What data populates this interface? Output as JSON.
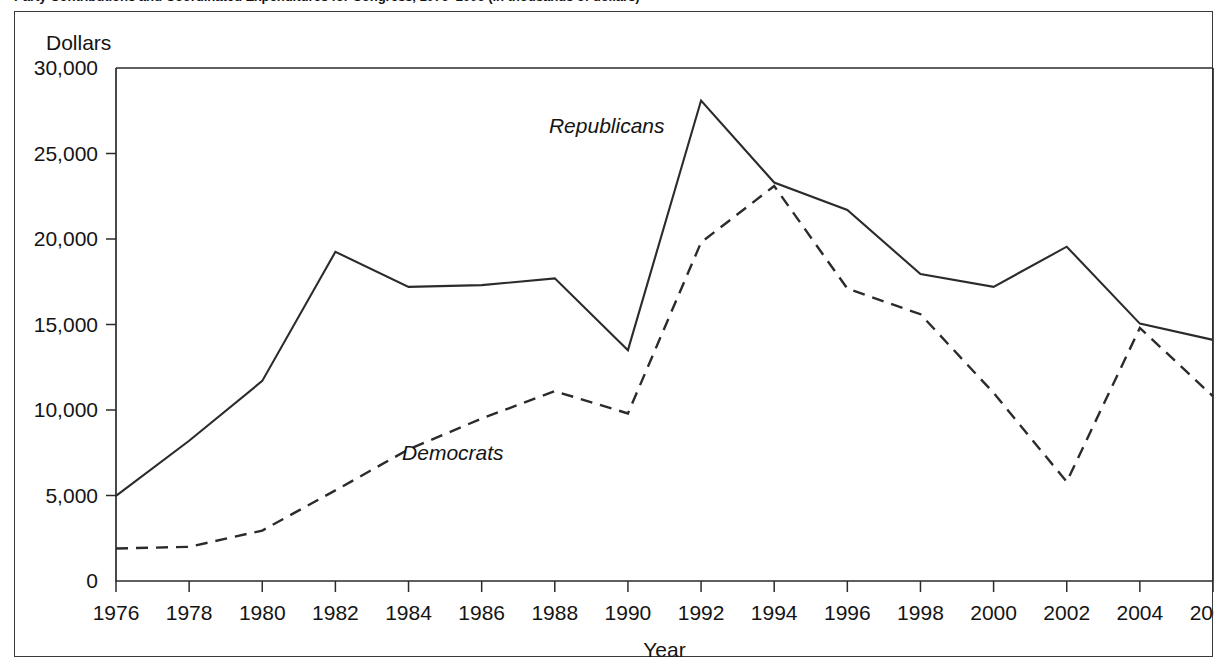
{
  "figure": {
    "number": "",
    "title": "Party Contributions and Coordinated Expenditures for Congress, 1976–2006 (in thousands of dollars)",
    "title_visible_fragment": "for Congress, 1976–2006 (in thousands of dollars)"
  },
  "axes": {
    "y_title": "Dollars",
    "x_title": "Year"
  },
  "colors": {
    "line": "#2b2b2b",
    "frame": "#3a3a3a",
    "background": "#ffffff",
    "text": "#141414"
  },
  "chart_data": {
    "type": "line",
    "title": "Party Contributions and Coordinated Expenditures for Congress, 1976–2006 (in thousands of dollars)",
    "xlabel": "Year",
    "ylabel": "Dollars",
    "xlim": [
      1976,
      2006
    ],
    "ylim": [
      0,
      30000
    ],
    "grid": false,
    "legend": "inline-labels",
    "x_ticks": [
      "1976",
      "1978",
      "1980",
      "1982",
      "1984",
      "1986",
      "1988",
      "1990",
      "1992",
      "1994",
      "1996",
      "1998",
      "2000",
      "2002",
      "2004",
      "2006"
    ],
    "y_ticks": [
      "0",
      "5,000",
      "10,000",
      "15,000",
      "20,000",
      "25,000",
      "30,000"
    ],
    "y_tick_values": [
      0,
      5000,
      10000,
      15000,
      20000,
      25000,
      30000
    ],
    "x": [
      1976,
      1978,
      1980,
      1982,
      1984,
      1986,
      1988,
      1990,
      1992,
      1994,
      1996,
      1998,
      2000,
      2002,
      2004,
      2006
    ],
    "series": [
      {
        "name": "Republicans",
        "style": "solid",
        "label_x": 1991.0,
        "label_y": 26200,
        "values": [
          4980,
          8200,
          11700,
          19250,
          17200,
          17300,
          17700,
          13500,
          28100,
          23300,
          21700,
          17950,
          17200,
          19550,
          15050,
          14100
        ]
      },
      {
        "name": "Democrats",
        "style": "dashed",
        "label_x": 1986.6,
        "label_y": 7100,
        "values": [
          1900,
          2000,
          2950,
          5300,
          7700,
          9500,
          11100,
          9800,
          19800,
          23100,
          17100,
          15600,
          11000,
          5800,
          14800,
          10800
        ]
      }
    ]
  }
}
